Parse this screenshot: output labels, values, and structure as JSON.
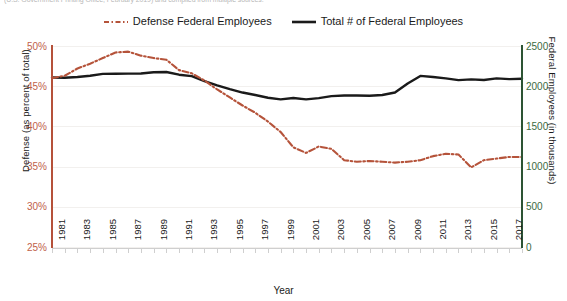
{
  "caption": {
    "top_cropped_text": "(U.S. Government Printing Office, February 2019) and compiled from multiple sources."
  },
  "legend": {
    "position": "top-center",
    "items": [
      {
        "label": "Defense Federal Employees",
        "color": "#b5533a",
        "style": "dash-dot",
        "name": "defense-federal-employees"
      },
      {
        "label": "Total # of Federal Employees",
        "color": "#1a1a1a",
        "style": "solid",
        "name": "total-federal-employees"
      }
    ]
  },
  "axes": {
    "left": {
      "title": "Defense (as percent of total)",
      "color": "#b5533a",
      "ticks": [
        "25%",
        "30%",
        "35%",
        "40%",
        "45%",
        "50%"
      ],
      "min": 25,
      "max": 50
    },
    "right": {
      "title": "Federal Employees (in thousands)",
      "color": "#2d5434",
      "ticks": [
        "0",
        "500",
        "1000",
        "1500",
        "2000",
        "2500"
      ],
      "min": 0,
      "max": 2500
    },
    "bottom": {
      "title": "Year",
      "ticks": [
        "1981",
        "1983",
        "1985",
        "1987",
        "1989",
        "1991",
        "1993",
        "1995",
        "1997",
        "1999",
        "2001",
        "2003",
        "2005",
        "2007",
        "2009",
        "2011",
        "2013",
        "2015",
        "2017"
      ]
    }
  },
  "chart_data": {
    "type": "line",
    "title": "",
    "xlabel": "Year",
    "ylabel": "Defense (as percent of total)",
    "ylabel_right": "Federal Employees (in thousands)",
    "grid": true,
    "legend_position": "top-center",
    "xlim": [
      1981,
      2018
    ],
    "ylim": [
      25,
      50
    ],
    "ylim_right": [
      0,
      2500
    ],
    "x": [
      1981,
      1982,
      1983,
      1984,
      1985,
      1986,
      1987,
      1988,
      1989,
      1990,
      1991,
      1992,
      1993,
      1994,
      1995,
      1996,
      1997,
      1998,
      1999,
      2000,
      2001,
      2002,
      2003,
      2004,
      2005,
      2006,
      2007,
      2008,
      2009,
      2010,
      2011,
      2012,
      2013,
      2014,
      2015,
      2016,
      2017,
      2018
    ],
    "series": [
      {
        "name": "Defense Federal Employees",
        "axis": "left",
        "unit": "percent of total",
        "color": "#b5533a",
        "style": "dash-dot",
        "values": [
          46.0,
          46.3,
          47.2,
          47.8,
          48.5,
          49.2,
          49.3,
          48.8,
          48.5,
          48.3,
          47.0,
          46.6,
          45.7,
          44.6,
          43.6,
          42.6,
          41.7,
          40.6,
          39.3,
          37.4,
          36.7,
          37.5,
          37.2,
          35.8,
          35.6,
          35.7,
          35.6,
          35.5,
          35.6,
          35.8,
          36.3,
          36.6,
          36.5,
          34.9,
          35.8,
          36.0,
          36.2,
          36.2
        ]
      },
      {
        "name": "Total # of Federal Employees",
        "axis": "right",
        "unit": "thousands",
        "color": "#1a1a1a",
        "style": "solid",
        "values": [
          2109,
          2105,
          2114,
          2130,
          2153,
          2154,
          2157,
          2158,
          2174,
          2177,
          2143,
          2125,
          2064,
          2010,
          1963,
          1921,
          1890,
          1856,
          1836,
          1853,
          1836,
          1852,
          1877,
          1885,
          1884,
          1882,
          1890,
          1921,
          2034,
          2128,
          2114,
          2097,
          2075,
          2085,
          2077,
          2097,
          2088,
          2093
        ]
      }
    ]
  }
}
